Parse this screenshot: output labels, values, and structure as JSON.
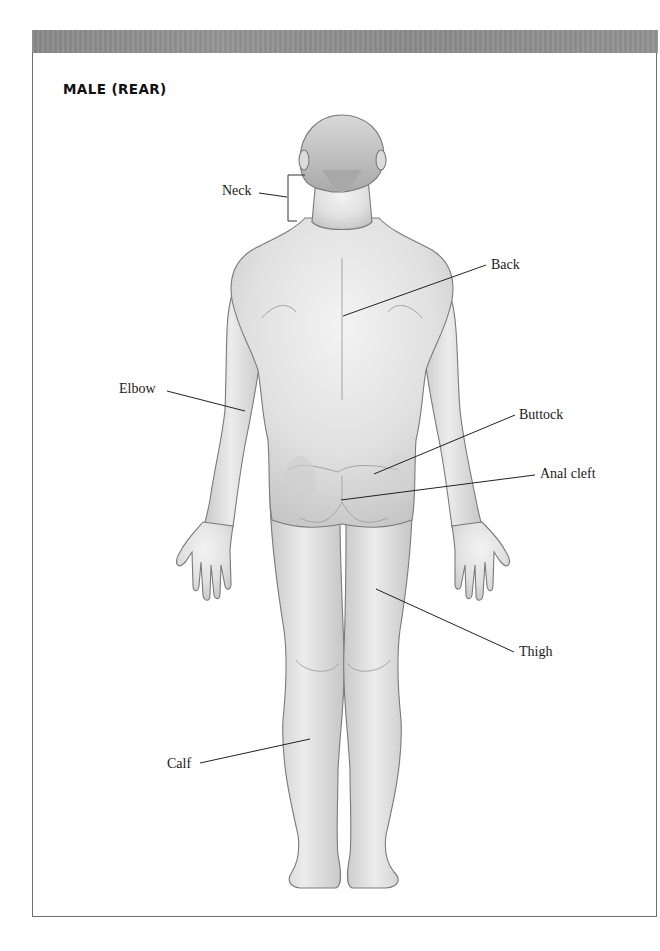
{
  "page": {
    "title": "MALE (REAR)",
    "header_bar_color": "#8f8f8f",
    "border_color": "#6e6e6e"
  },
  "figure": {
    "skin_color": "#e2e2e2",
    "outline_color": "#7a7a7a"
  },
  "labels": [
    {
      "id": "neck",
      "text": "Neck"
    },
    {
      "id": "back",
      "text": "Back"
    },
    {
      "id": "elbow",
      "text": "Elbow"
    },
    {
      "id": "buttock",
      "text": "Buttock"
    },
    {
      "id": "anal-cleft",
      "text": "Anal cleft"
    },
    {
      "id": "thigh",
      "text": "Thigh"
    },
    {
      "id": "calf",
      "text": "Calf"
    }
  ]
}
